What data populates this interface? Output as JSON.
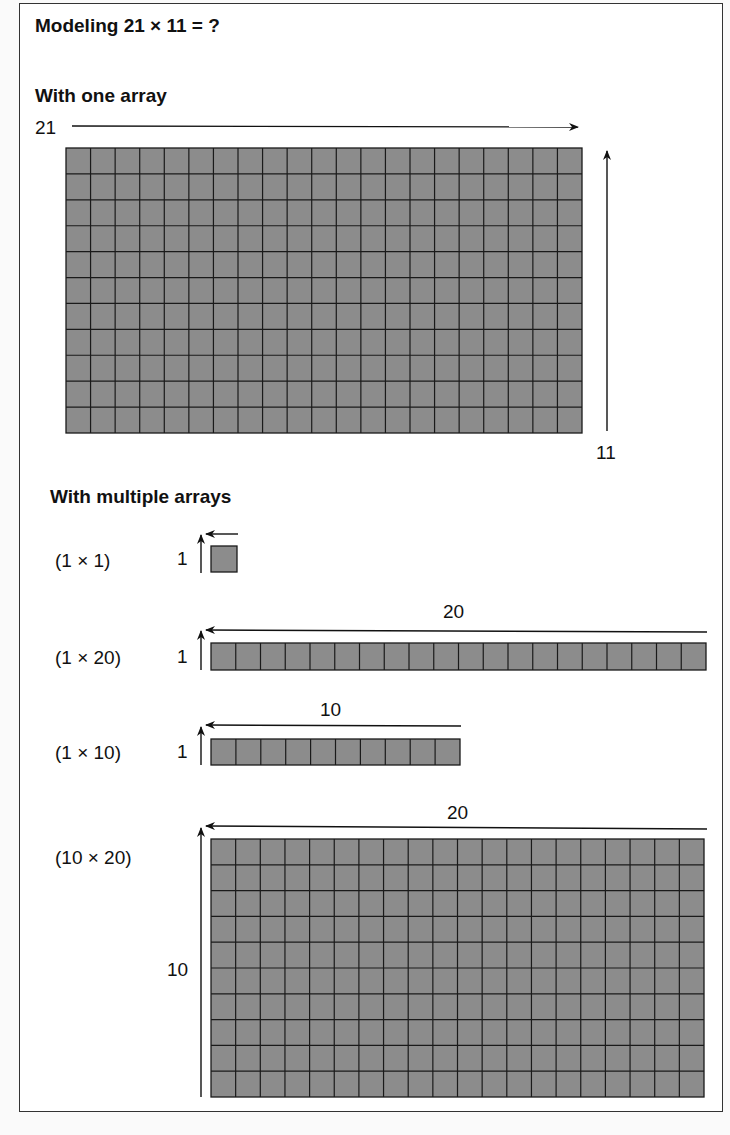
{
  "title": "Modeling 21 × 11 = ?",
  "section_one": {
    "heading": "With one array",
    "width_label": "21",
    "height_label": "11",
    "array": {
      "rows": 11,
      "cols": 21
    }
  },
  "section_multi": {
    "heading": "With multiple arrays",
    "arrays": [
      {
        "label": "(1 × 1)",
        "rows": 1,
        "cols": 1,
        "row_label": "1",
        "col_label": ""
      },
      {
        "label": "(1 × 20)",
        "rows": 1,
        "cols": 20,
        "row_label": "1",
        "col_label": "20"
      },
      {
        "label": "(1 × 10)",
        "rows": 1,
        "cols": 10,
        "row_label": "1",
        "col_label": "10"
      },
      {
        "label": "(10 × 20)",
        "rows": 10,
        "cols": 20,
        "row_label": "10",
        "col_label": "20"
      }
    ]
  },
  "colors": {
    "cell_fill": "#8c8c8c",
    "grid_line": "#1a1a1a",
    "arrow": "#111111",
    "border": "#333333"
  }
}
